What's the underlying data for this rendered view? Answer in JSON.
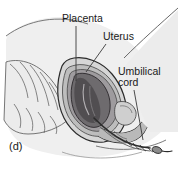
{
  "figure": {
    "panel_label": "(d)",
    "style": "grayscale-line-drawing",
    "colors": {
      "background": "#ffffff",
      "body_fill": "#efefef",
      "body_shade": "#e2e2e2",
      "uterus_wall": "#cfcfcf",
      "uterus_inner": "#9a9a9a",
      "placenta_fill": "#6e6b6e",
      "placenta_dark": "#4a474a",
      "bone_fill": "#e8e8e8",
      "outline": "#2b2b2b",
      "leader_line": "#3a3a3a",
      "text": "#1a1a1a"
    },
    "labels": [
      {
        "id": "placenta",
        "text": "Placenta",
        "leader": {
          "x1": 76,
          "y1": 26,
          "x2": 76,
          "y2": 81
        }
      },
      {
        "id": "uterus",
        "text": "Uterus",
        "leader": {
          "x1": 106,
          "y1": 44,
          "x2": 86,
          "y2": 72
        }
      },
      {
        "id": "umbilical_cord",
        "line1": "Umbilical",
        "line2": "cord",
        "leader": {
          "x1": 134,
          "y1": 90,
          "x2": 143,
          "y2": 140
        }
      }
    ]
  }
}
